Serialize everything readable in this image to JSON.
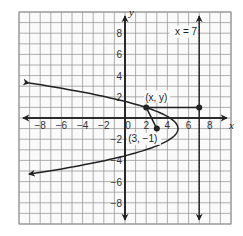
{
  "chart_data": {
    "type": "line",
    "title": "",
    "xlabel": "x",
    "ylabel": "y",
    "xlim": [
      -10,
      10
    ],
    "ylim": [
      -10,
      10
    ],
    "grid": true,
    "x_ticks": [
      -8,
      -6,
      -4,
      -2,
      0,
      2,
      4,
      6,
      8
    ],
    "y_ticks": [
      8,
      6,
      4,
      2,
      -2,
      -4,
      -6,
      -8
    ],
    "series": [
      {
        "name": "parabola",
        "kind": "curve",
        "equation": "horizontal parabola opening left, vertex (5, -1)",
        "vertex": [
          5,
          -1
        ],
        "points": [
          [
            -9.5,
            3.3
          ],
          [
            -4,
            2.4
          ],
          [
            0,
            1.6
          ],
          [
            2,
            1
          ],
          [
            4,
            0.1
          ],
          [
            5,
            -1
          ],
          [
            4,
            -2.1
          ],
          [
            0,
            -3.6
          ],
          [
            -4,
            -4.4
          ],
          [
            -9.5,
            -5.3
          ]
        ],
        "arrows": "both ends"
      },
      {
        "name": "directrix",
        "kind": "dashed vertical line",
        "x": 7,
        "label": "x = 7"
      },
      {
        "name": "segment to focus",
        "kind": "segment",
        "points": [
          [
            2,
            1
          ],
          [
            3,
            -1
          ]
        ]
      },
      {
        "name": "segment to directrix",
        "kind": "segment",
        "points": [
          [
            2,
            1
          ],
          [
            7,
            1
          ]
        ]
      }
    ],
    "annotations": [
      {
        "text": "(x, y)",
        "at": [
          2,
          1
        ]
      },
      {
        "text": "(3, −1)",
        "at": [
          3,
          -1
        ]
      },
      {
        "text": "x = 7",
        "at": [
          7,
          8
        ]
      }
    ],
    "points": [
      {
        "label": "(x, y)",
        "x": 2,
        "y": 1
      },
      {
        "label": "(3, −1)",
        "x": 3,
        "y": -1
      },
      {
        "label": "",
        "x": 7,
        "y": 1
      }
    ]
  },
  "labels": {
    "x_axis": "x",
    "y_axis": "y",
    "origin": "0",
    "point_xy": "(x, y)",
    "focus": "(3, −1)",
    "directrix": "x = 7"
  }
}
